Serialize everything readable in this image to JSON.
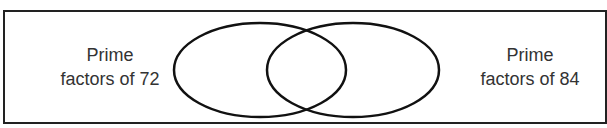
{
  "diagram": {
    "type": "venn",
    "sets": [
      {
        "label_line1": "Prime",
        "label_line2": "factors of 72"
      },
      {
        "label_line1": "Prime",
        "label_line2": "factors of 84"
      }
    ],
    "colors": {
      "stroke": "#111111",
      "text": "#333333",
      "background": "#ffffff"
    }
  }
}
